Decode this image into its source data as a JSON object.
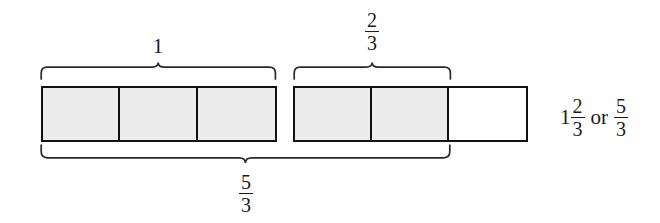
{
  "figure": {
    "title_alt": "Fraction bar model showing one whole plus two thirds",
    "colors": {
      "shaded_fill": "#ececec",
      "empty_fill": "#ffffff",
      "stroke": "#111111",
      "text": "#1a1a1a",
      "background": "#ffffff"
    },
    "bars": [
      {
        "name": "first-whole-bar",
        "cells": [
          {
            "state": "shaded"
          },
          {
            "state": "shaded"
          },
          {
            "state": "shaded"
          }
        ]
      },
      {
        "name": "second-partial-bar",
        "cells": [
          {
            "state": "shaded"
          },
          {
            "state": "shaded"
          },
          {
            "state": "empty"
          }
        ]
      }
    ],
    "braces": [
      {
        "name": "brace-whole",
        "direction": "up",
        "label_kind": "integer",
        "label": "1",
        "numerator": "",
        "denominator": ""
      },
      {
        "name": "brace-two-thirds",
        "direction": "up",
        "label_kind": "fraction",
        "label": "2/3",
        "numerator": "2",
        "denominator": "3"
      },
      {
        "name": "brace-five-thirds",
        "direction": "down",
        "label_kind": "fraction",
        "label": "5/3",
        "numerator": "5",
        "denominator": "3"
      }
    ],
    "result": {
      "name": "result-expression",
      "whole": "1",
      "mixed_numerator": "2",
      "mixed_denominator": "3",
      "conjunction": "or",
      "improper_numerator": "5",
      "improper_denominator": "3",
      "plain_text": "1 2/3 or 5/3"
    }
  }
}
